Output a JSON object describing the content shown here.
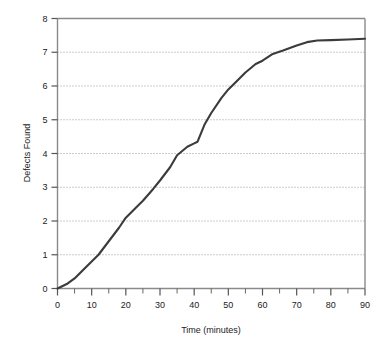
{
  "chart_data": {
    "type": "line",
    "title": "",
    "xlabel": "Time (minutes)",
    "ylabel": "Defects Found",
    "xlim": [
      0,
      90
    ],
    "ylim": [
      0,
      8
    ],
    "grid": true,
    "grid_axis": "y",
    "grid_style": "dotted",
    "legend": "none",
    "line_color": "#3b3b3b",
    "axis_color": "#8a8a8a",
    "grid_color": "#9a9a9a",
    "text_color": "#1b1b1b",
    "xticks": [
      0,
      10,
      20,
      30,
      40,
      50,
      60,
      70,
      80,
      90
    ],
    "xtick_labels": [
      "0",
      "10",
      "20",
      "30",
      "40",
      "50",
      "60",
      "70",
      "80",
      "90"
    ],
    "xminor_ticks": [
      5,
      15,
      25,
      35,
      45,
      55,
      65,
      75,
      85
    ],
    "yticks": [
      0,
      1,
      2,
      3,
      4,
      5,
      6,
      7,
      8
    ],
    "ytick_labels": [
      "0",
      "1",
      "2",
      "3",
      "4",
      "5",
      "6",
      "7",
      "8"
    ],
    "series": [
      {
        "name": "Defects Found",
        "x": [
          0,
          3,
          5,
          8,
          12,
          15,
          18,
          20,
          23,
          25,
          28,
          30,
          33,
          35,
          38,
          40,
          41,
          43,
          45,
          48,
          50,
          52,
          55,
          58,
          60,
          63,
          66,
          70,
          73,
          76,
          80,
          85,
          90
        ],
        "y": [
          0.0,
          0.15,
          0.3,
          0.6,
          1.0,
          1.4,
          1.8,
          2.1,
          2.4,
          2.6,
          2.95,
          3.2,
          3.6,
          3.95,
          4.2,
          4.3,
          4.35,
          4.85,
          5.2,
          5.65,
          5.9,
          6.1,
          6.4,
          6.65,
          6.75,
          6.95,
          7.05,
          7.2,
          7.3,
          7.35,
          7.36,
          7.38,
          7.4
        ]
      }
    ]
  }
}
